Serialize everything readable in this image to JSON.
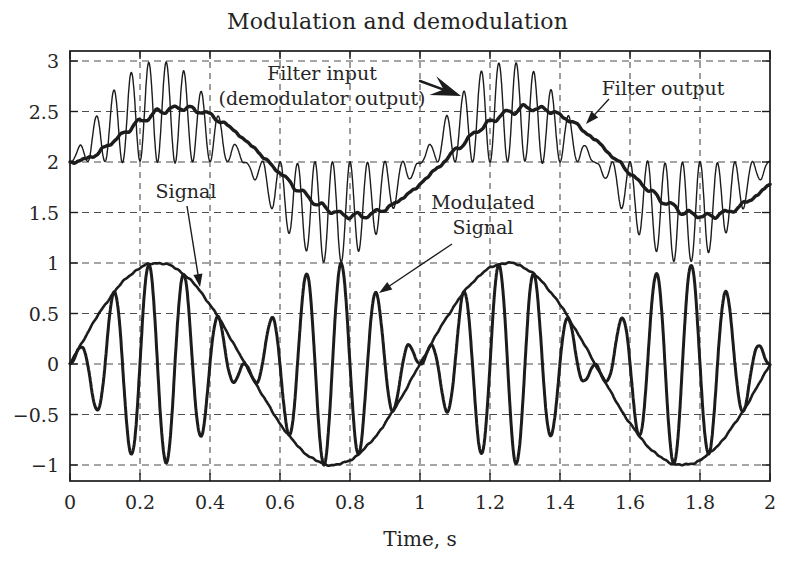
{
  "chart_data": {
    "type": "line",
    "title": "Modulation and demodulation",
    "xlabel": "Time, s",
    "ylabel": "",
    "xlim": [
      0,
      2
    ],
    "ylim": [
      -1.16,
      3.1
    ],
    "xticks": [
      0,
      0.2,
      0.4,
      0.6,
      0.8,
      1,
      1.2,
      1.4,
      1.6,
      1.8,
      2
    ],
    "xtick_labels": [
      "0",
      "0.2",
      "0.4",
      "0.6",
      "0.8",
      "1",
      "1.2",
      "1.4",
      "1.6",
      "1.8",
      "2"
    ],
    "yticks": [
      -1,
      -0.5,
      0,
      0.5,
      1,
      1.5,
      2,
      2.5,
      3
    ],
    "ytick_labels": [
      "−1",
      "−0.5",
      "0",
      "0.5",
      "1",
      "1.5",
      "2",
      "2.5",
      "3"
    ],
    "grid": "dashed",
    "legend_position": "none",
    "series": [
      {
        "name": "Signal",
        "formula": "sin(2*pi*1*t)",
        "frequency_hz": 1,
        "amplitude": 1,
        "offset": 0,
        "line_width": 2.6
      },
      {
        "name": "Modulated Signal",
        "formula": "sin(2*pi*1*t)*sin(2*pi*10*t)",
        "envelope_frequency_hz": 1,
        "carrier_frequency_hz": 10,
        "amplitude": 1,
        "offset": 0,
        "line_width": 3
      },
      {
        "name": "Filter input (demodulator output)",
        "formula": "2 + sin(2*pi*1*t)*sin(2*pi*10*t)^2",
        "offset": 2,
        "hump_range": [
          1,
          3
        ],
        "ripple_frequency_hz": 20,
        "line_width": 1.4
      },
      {
        "name": "Filter output",
        "formula": "lowpass(filter input) ~ 2 + 0.5*sin(2*pi*(t-0.07))",
        "offset": 2,
        "amplitude": 0.5,
        "delay_s": 0.07,
        "lowpass_tau_s": 0.035,
        "line_width": 3.4
      }
    ],
    "annotations": [
      {
        "lines": [
          "Filter input",
          "(demodulator output)"
        ],
        "cx": 322,
        "baseline_y": 80,
        "line_height": 25,
        "arrow": {
          "from": [
            420,
            81
          ],
          "to": [
            461,
            96
          ],
          "style": "bold-dart"
        }
      },
      {
        "lines": [
          "Filter output"
        ],
        "cx": 663,
        "baseline_y": 95,
        "line_height": 25,
        "arrow": {
          "from": [
            609,
            99
          ],
          "to": [
            586,
            124
          ],
          "style": "thin"
        }
      },
      {
        "lines": [
          "Signal"
        ],
        "cx": 186,
        "baseline_y": 198,
        "line_height": 25,
        "arrow": {
          "from": [
            187,
            206
          ],
          "to": [
            200,
            287
          ],
          "style": "thin"
        }
      },
      {
        "lines": [
          "Modulated",
          "Signal"
        ],
        "cx": 483,
        "baseline_y": 209,
        "line_height": 25,
        "arrow": {
          "from": [
            452,
            244
          ],
          "to": [
            379,
            293
          ],
          "style": "thin"
        }
      }
    ],
    "colors": {
      "ink": "#1c1c1c",
      "grid": "#4d4d4d",
      "background": "#ffffff"
    }
  }
}
